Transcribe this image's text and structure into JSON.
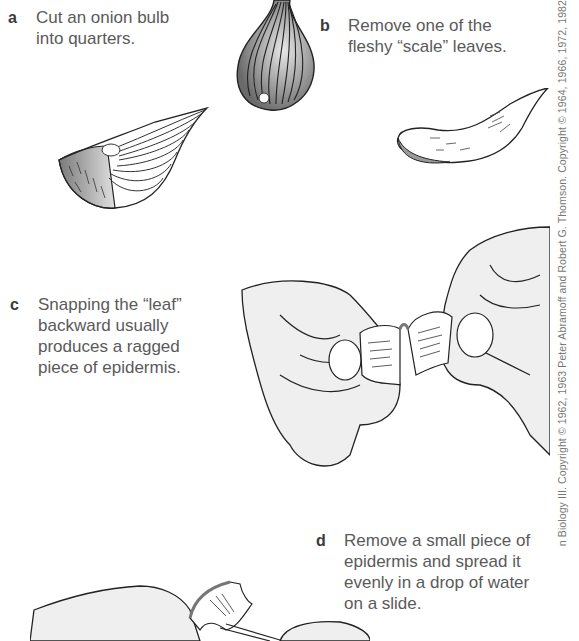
{
  "steps": [
    {
      "letter": "a",
      "text": "Cut an onion bulb\ninto quarters."
    },
    {
      "letter": "b",
      "text": "Remove one of the\nfleshy “scale” leaves."
    },
    {
      "letter": "c",
      "text": "Snapping the “leaf”\nbackward usually\nproduces a ragged\npiece  of epidermis."
    },
    {
      "letter": "d",
      "text": "Remove a small piece of\nepidermis and spread it\nevenly in a drop of water\non a slide."
    }
  ],
  "credit": "n Biology III. Copyright © 1962, 1963 Peter Abramoff and Robert G. Thomson. Copyright © 1964, 1966, 1972, 1982",
  "illustrations": {
    "whole_onion": "whole-onion-bulb",
    "onion_quarter": "onion-quarter",
    "scale_leaf": "fleshy-scale-leaf",
    "hands_snapping": "hands-snapping-leaf",
    "hands_peeling": "hands-peeling-epidermis"
  },
  "colors": {
    "text": "#5a5a5a",
    "letter": "#3a3a3a",
    "line": "#2a2a2a",
    "shade": "#9a9a9a",
    "skin": "#ededed"
  }
}
